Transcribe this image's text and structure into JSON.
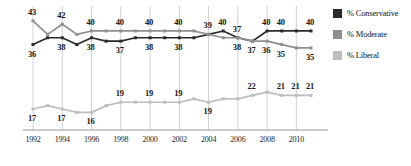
{
  "chart_data": {
    "type": "line",
    "title": "",
    "xlabel": "",
    "ylabel": "",
    "grid": true,
    "legend_position": "right",
    "x": [
      1992,
      1993,
      1994,
      1995,
      1996,
      1997,
      1998,
      1999,
      2000,
      2001,
      2002,
      2003,
      2004,
      2005,
      2006,
      2007,
      2008,
      2009,
      2010,
      2011
    ],
    "xticks": [
      "1992",
      "1994",
      "1996",
      "1998",
      "2000",
      "2002",
      "2004",
      "2006",
      "2008",
      "2010"
    ],
    "xtick_values": [
      1992,
      1994,
      1996,
      1998,
      2000,
      2002,
      2004,
      2006,
      2008,
      2010
    ],
    "ylim": [
      12,
      45
    ],
    "series": [
      {
        "name": "% Conservative",
        "color": "#2b2b2b",
        "values": [
          36,
          38,
          38,
          36,
          38,
          37,
          37,
          38,
          38,
          38,
          38,
          38,
          39,
          40,
          38,
          37,
          40,
          40,
          40,
          40
        ],
        "labels": [
          {
            "x": 1992,
            "text": "36",
            "pos": "below"
          },
          {
            "x": 1994,
            "text": "38",
            "pos": "below"
          },
          {
            "x": 1996,
            "text": "38",
            "pos": "below"
          },
          {
            "x": 1998,
            "text": "37",
            "pos": "below"
          },
          {
            "x": 2000,
            "text": "38",
            "pos": "below"
          },
          {
            "x": 2002,
            "text": "38",
            "pos": "below"
          },
          {
            "x": 2004,
            "text": "39",
            "pos": "above"
          },
          {
            "x": 2005,
            "text": "40",
            "pos": "above"
          },
          {
            "x": 2006,
            "text": "38",
            "pos": "below"
          },
          {
            "x": 2008,
            "text": "40",
            "pos": "above"
          },
          {
            "x": 2009,
            "text": "40",
            "pos": "above"
          },
          {
            "x": 2011,
            "text": "40",
            "pos": "above"
          }
        ]
      },
      {
        "name": "% Moderate",
        "color": "#8f8f8f",
        "values": [
          43,
          39,
          42,
          39,
          40,
          40,
          40,
          40,
          40,
          40,
          40,
          40,
          39,
          38,
          38,
          37,
          37,
          36,
          35,
          35
        ],
        "labels": [
          {
            "x": 1992,
            "text": "43",
            "pos": "above"
          },
          {
            "x": 1994,
            "text": "42",
            "pos": "above"
          },
          {
            "x": 1996,
            "text": "40",
            "pos": "above"
          },
          {
            "x": 1998,
            "text": "40",
            "pos": "above"
          },
          {
            "x": 2000,
            "text": "40",
            "pos": "above"
          },
          {
            "x": 2002,
            "text": "40",
            "pos": "above"
          },
          {
            "x": 2006,
            "text": "37",
            "pos": "above"
          },
          {
            "x": 2007,
            "text": "37",
            "pos": "below"
          },
          {
            "x": 2008,
            "text": "36",
            "pos": "below"
          },
          {
            "x": 2009,
            "text": "35",
            "pos": "below"
          },
          {
            "x": 2011,
            "text": "35",
            "pos": "below"
          }
        ]
      },
      {
        "name": "% Liberal",
        "color": "#bdbdbd",
        "values": [
          17,
          18,
          17,
          16,
          16,
          18,
          19,
          19,
          19,
          19,
          19,
          20,
          19,
          20,
          20,
          21,
          22,
          21,
          21,
          21
        ],
        "labels": [
          {
            "x": 1992,
            "text": "17",
            "pos": "below"
          },
          {
            "x": 1994,
            "text": "17",
            "pos": "below"
          },
          {
            "x": 1996,
            "text": "16",
            "pos": "below"
          },
          {
            "x": 1998,
            "text": "19",
            "pos": "above"
          },
          {
            "x": 2000,
            "text": "19",
            "pos": "above"
          },
          {
            "x": 2002,
            "text": "19",
            "pos": "above"
          },
          {
            "x": 2004,
            "text": "19",
            "pos": "below"
          },
          {
            "x": 2007,
            "text": "22",
            "pos": "above"
          },
          {
            "x": 2009,
            "text": "21",
            "pos": "above"
          },
          {
            "x": 2010,
            "text": "21",
            "pos": "above"
          },
          {
            "x": 2011,
            "text": "21",
            "pos": "above"
          }
        ]
      }
    ]
  },
  "legend": {
    "items": [
      {
        "label": "% Conservative",
        "color": "#2b2b2b"
      },
      {
        "label": "% Moderate",
        "color": "#8f8f8f"
      },
      {
        "label": "% Liberal",
        "color": "#bdbdbd"
      }
    ]
  },
  "colors": {
    "conservative": "#2b2b2b",
    "moderate": "#8f8f8f",
    "liberal": "#bdbdbd",
    "gridline": "#d2d2d2",
    "axis": "#9a9a9a",
    "text": "#161616"
  }
}
